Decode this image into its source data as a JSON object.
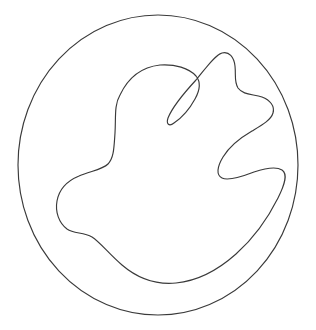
{
  "figure": {
    "type": "line-drawing",
    "background_color": "#ffffff",
    "stroke_color": "#3a3a3a",
    "stroke_width": 1.15,
    "canvas": {
      "width": 316,
      "height": 330
    },
    "shapes": [
      {
        "name": "outer-circle",
        "kind": "circle",
        "center_x": 158,
        "center_y": 165,
        "radius": 140,
        "path": "M 298 165 A 140 150 0 1 1 18 165 A 140 150 0 1 1 298 165 Z"
      },
      {
        "name": "inner-blob",
        "kind": "closed-curve",
        "leftmost_x": 57,
        "rightmost_x": 285,
        "topmost_y": 52,
        "bottommost_y": 283,
        "path": "M 120 95 C 128 78, 142 67, 160 65 C 175 64, 189 68, 196 76 C 201 82, 200 90, 195 99 C 189 110, 180 119, 174 123 C 169 127, 166 124, 168 118 C 172 108, 184 93, 196 80 C 206 68, 215 55, 222 53 C 229 51, 234 57, 235 66 C 236 75, 234 82, 238 88 C 243 95, 253 94, 262 97 C 270 100, 275 106, 273 113 C 271 120, 262 125, 252 131 C 240 138, 229 147, 223 157 C 217 167, 216 175, 222 178 C 228 181, 241 177, 254 172 C 266 168, 276 166, 282 170 C 288 174, 285 184, 278 198 C 269 216, 254 238, 236 254 C 218 270, 197 281, 176 283 C 155 285, 136 277, 122 265 C 109 254, 100 242, 92 237 C 83 232, 74 234, 67 229 C 59 223, 55 212, 57 201 C 59 190, 67 181, 79 176 C 90 171, 102 170, 108 164 C 114 158, 114 147, 115 133 C 116 118, 114 105, 120 95 Z"
      }
    ]
  }
}
